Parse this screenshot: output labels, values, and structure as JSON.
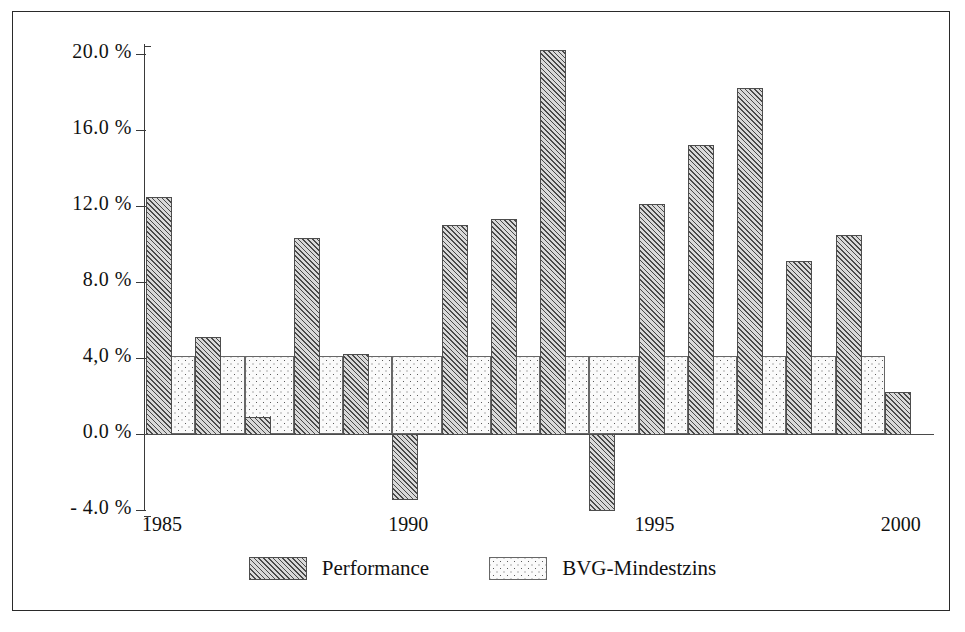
{
  "chart_data": {
    "type": "bar",
    "title": "",
    "subtitle": "",
    "xlabel": "",
    "ylabel": "",
    "ylim": [
      -4.3,
      20.4
    ],
    "yticks": [
      -4.0,
      0.0,
      4.0,
      8.0,
      12.0,
      16.0,
      20.0
    ],
    "ytick_labels": [
      "- 4.0 %",
      "0.0 %",
      "4,0 %",
      "8.0 %",
      "12.0 %",
      "16.0 %",
      "20.0 %"
    ],
    "x": [
      1985,
      1986,
      1987,
      1988,
      1989,
      1990,
      1991,
      1992,
      1993,
      1994,
      1995,
      1996,
      1997,
      1998,
      1999,
      2000
    ],
    "xtick_labels": [
      "1985",
      "1990",
      "1995",
      "2000"
    ],
    "xticks": [
      1985,
      1990,
      1995,
      2000
    ],
    "grid": false,
    "legend_position": "bottom",
    "series": [
      {
        "name": "Performance",
        "pattern": "diagonal-hatch",
        "values": [
          12.5,
          5.1,
          0.9,
          10.3,
          4.2,
          -3.4,
          11.0,
          11.3,
          20.2,
          -4.0,
          12.1,
          15.2,
          18.2,
          9.1,
          10.5,
          2.2
        ]
      },
      {
        "name": "BVG-Mindestzins",
        "pattern": "dotted",
        "values": [
          4.1,
          4.1,
          4.1,
          4.1,
          4.1,
          4.1,
          4.1,
          4.1,
          4.1,
          4.1,
          4.1,
          4.1,
          4.1,
          4.1,
          4.1,
          null
        ]
      }
    ]
  },
  "legend": {
    "items": [
      {
        "label": "Performance",
        "pattern": "diagonal-hatch"
      },
      {
        "label": "BVG-Mindestzins",
        "pattern": "dotted"
      }
    ]
  },
  "axis": {
    "y_labels": [
      "20.0 %",
      "16.0 %",
      "12.0 %",
      "8.0 %",
      "4,0 %",
      "0.0 %",
      "- 4.0 %"
    ],
    "x_labels": [
      "1985",
      "1990",
      "1995",
      "2000"
    ]
  },
  "colors": {
    "ink": "#111111",
    "line": "#3a3a3a",
    "hatch": "#4a4a4a",
    "dot": "#5b5b5b",
    "background": "#ffffff"
  }
}
